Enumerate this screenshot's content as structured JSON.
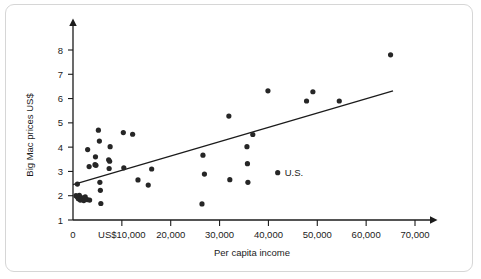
{
  "figure": {
    "frame_border_color": "#d6d6d6",
    "background_color": "#ffffff",
    "ink_color": "#1b1b1b"
  },
  "chart_data": {
    "type": "scatter",
    "title": "",
    "xlabel": "Per capita income",
    "ylabel": "Big Mac prices US$",
    "xlim": [
      0,
      73000
    ],
    "ylim": [
      1,
      8.6
    ],
    "grid": false,
    "legend": null,
    "xticks": [
      0,
      10000,
      20000,
      30000,
      40000,
      50000,
      60000,
      70000
    ],
    "xticklabels": [
      "0",
      "US$10,000",
      "20,000",
      "30,000",
      "40,000",
      "50,000",
      "60,000",
      "70,000"
    ],
    "yticks": [
      1,
      2,
      3,
      4,
      5,
      6,
      7,
      8
    ],
    "yticklabels": [
      "1",
      "2",
      "3",
      "4",
      "5",
      "6",
      "7",
      "8"
    ],
    "marker_color": "#262626",
    "marker_radius": 2.6,
    "points": [
      {
        "x": 600,
        "y": 2.0
      },
      {
        "x": 900,
        "y": 1.95
      },
      {
        "x": 1100,
        "y": 1.88
      },
      {
        "x": 1300,
        "y": 2.02
      },
      {
        "x": 1500,
        "y": 1.82
      },
      {
        "x": 1700,
        "y": 1.92
      },
      {
        "x": 1900,
        "y": 1.86
      },
      {
        "x": 2200,
        "y": 1.8
      },
      {
        "x": 2500,
        "y": 1.95
      },
      {
        "x": 2900,
        "y": 1.84
      },
      {
        "x": 3400,
        "y": 1.82
      },
      {
        "x": 900,
        "y": 2.48
      },
      {
        "x": 3000,
        "y": 3.9
      },
      {
        "x": 3300,
        "y": 3.2
      },
      {
        "x": 4500,
        "y": 3.28
      },
      {
        "x": 4700,
        "y": 3.25
      },
      {
        "x": 4600,
        "y": 3.6
      },
      {
        "x": 5200,
        "y": 4.7
      },
      {
        "x": 5400,
        "y": 4.25
      },
      {
        "x": 5500,
        "y": 2.55
      },
      {
        "x": 5600,
        "y": 2.22
      },
      {
        "x": 5700,
        "y": 1.68
      },
      {
        "x": 7300,
        "y": 3.48
      },
      {
        "x": 7500,
        "y": 3.42
      },
      {
        "x": 7400,
        "y": 3.12
      },
      {
        "x": 7600,
        "y": 4.02
      },
      {
        "x": 10300,
        "y": 4.6
      },
      {
        "x": 10400,
        "y": 3.15
      },
      {
        "x": 12200,
        "y": 4.53
      },
      {
        "x": 13300,
        "y": 2.65
      },
      {
        "x": 15400,
        "y": 2.44
      },
      {
        "x": 16100,
        "y": 3.1
      },
      {
        "x": 26400,
        "y": 1.66
      },
      {
        "x": 26600,
        "y": 3.67
      },
      {
        "x": 26900,
        "y": 2.89
      },
      {
        "x": 31900,
        "y": 5.28
      },
      {
        "x": 32100,
        "y": 2.66
      },
      {
        "x": 35600,
        "y": 4.02
      },
      {
        "x": 35700,
        "y": 3.32
      },
      {
        "x": 35800,
        "y": 2.55
      },
      {
        "x": 36800,
        "y": 4.52
      },
      {
        "x": 39900,
        "y": 6.32
      },
      {
        "x": 41900,
        "y": 2.95
      },
      {
        "x": 47800,
        "y": 5.9
      },
      {
        "x": 49100,
        "y": 6.28
      },
      {
        "x": 54500,
        "y": 5.9
      },
      {
        "x": 65000,
        "y": 7.8
      }
    ],
    "annotations": [
      {
        "label": "U.S.",
        "x": 41900,
        "y": 2.95,
        "dx": 7,
        "dy": 3
      }
    ],
    "trend_line": {
      "x0": 0,
      "y0": 2.46,
      "x1": 65500,
      "y1": 6.32
    }
  }
}
